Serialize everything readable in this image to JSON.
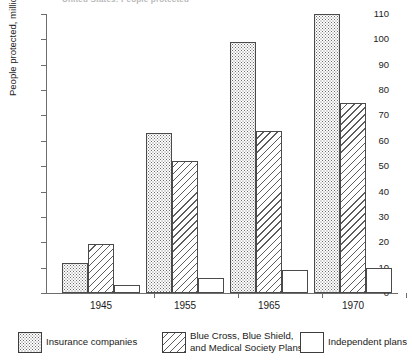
{
  "title_strip": "United States: People protected",
  "chart_data": {
    "type": "bar",
    "title": "United States: People protected",
    "xlabel": "",
    "ylabel": "People protected, millions",
    "categories": [
      "1945",
      "1955",
      "1965",
      "1970"
    ],
    "ylim": [
      0,
      110
    ],
    "yticks": [
      0,
      10,
      20,
      30,
      40,
      50,
      60,
      70,
      80,
      90,
      100,
      110
    ],
    "grid": false,
    "legend_position": "bottom",
    "series": [
      {
        "name": "Insurance companies",
        "fill": "dotted",
        "values": [
          12,
          63,
          99,
          110
        ]
      },
      {
        "name": "Blue Cross, Blue Shield, and Medical Society Plans",
        "fill": "diagonal-hatch",
        "values": [
          19.5,
          52,
          64,
          75
        ]
      },
      {
        "name": "Independent plans",
        "fill": "white",
        "values": [
          3,
          6,
          9,
          10
        ]
      }
    ]
  },
  "legend": {
    "items": [
      {
        "label_line1": "Insurance companies",
        "label_line2": ""
      },
      {
        "label_line1": "Blue Cross, Blue Shield,",
        "label_line2": "and Medical Society Plans"
      },
      {
        "label_line1": "Independent plans",
        "label_line2": ""
      }
    ]
  },
  "colors": {
    "axis": "#6d6d6d",
    "bar_outline": "#4a4a4a",
    "hatch": "#5d5d5d",
    "dot": "#6b6b6b",
    "text": "#1a1a1a",
    "background": "#ffffff"
  }
}
